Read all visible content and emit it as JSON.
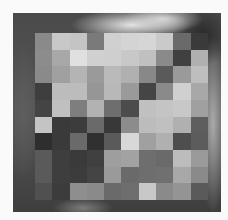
{
  "image": {
    "description": "Grayscale photograph with a pixelated mosaic region obscuring the center",
    "mosaic": {
      "rows": 10,
      "cols": 10,
      "cells": [
        [
          "#8a8a8a",
          "#c8c8c8",
          "#c4c4c4",
          "#7a7a7a",
          "#d0d0d0",
          "#d4d4d4",
          "#d6d6d6",
          "#cacaca",
          "#6a6a6a",
          "#3a3a3a"
        ],
        [
          "#8c8c8c",
          "#a8a8a8",
          "#e0e0e0",
          "#d0d0d0",
          "#cfcfcf",
          "#c8c8c8",
          "#c0c0c0",
          "#8a8a8a",
          "#404040",
          "#b0b0b0"
        ],
        [
          "#8a8a8a",
          "#a0a0a0",
          "#b4b4b4",
          "#9a9a9a",
          "#bababa",
          "#b0b0b0",
          "#888888",
          "#5a5a5a",
          "#9a9a9a",
          "#bebebe"
        ],
        [
          "#3e3e3e",
          "#bcbcbc",
          "#bcbcbc",
          "#969696",
          "#b8b8b8",
          "#9a9a9a",
          "#454545",
          "#8a8a8a",
          "#d0d0d0",
          "#a8a8a8"
        ],
        [
          "#444444",
          "#c0c0c0",
          "#7e7e7e",
          "#b2b2b2",
          "#6e6e6e",
          "#4c4c4c",
          "#c0c0c0",
          "#c4c4c4",
          "#c8c8c8",
          "#a0a0a0"
        ],
        [
          "#c4c4c4",
          "#3a3a3a",
          "#3c3c3c",
          "#6a6a6a",
          "#383838",
          "#8c8c8c",
          "#bcbcbc",
          "#c0c0c0",
          "#b0b0b0",
          "#5e5e5e"
        ],
        [
          "#2e2e2e",
          "#3a3a3a",
          "#6a6a6a",
          "#303030",
          "#5a5a5a",
          "#d8d8d8",
          "#a0a0a0",
          "#b0b0b0",
          "#4e4e4e",
          "#5c5c5c"
        ],
        [
          "#5a5a5a",
          "#3e3e3e",
          "#3a3a3a",
          "#404040",
          "#9e9e9e",
          "#a2a2a2",
          "#6e6e6e",
          "#6a6a6a",
          "#bcbcbc",
          "#9a9a9a"
        ],
        [
          "#5a5a5a",
          "#3e3e3e",
          "#3c3c3c",
          "#444444",
          "#9a9a9a",
          "#6a6a6a",
          "#6e6e6e",
          "#707070",
          "#a8a8a8",
          "#8a8a8a"
        ],
        [
          "#505050",
          "#3c3c3c",
          "#8e8e8e",
          "#8a8a8a",
          "#6a6a6a",
          "#6e6e6e",
          "#c8c8c8",
          "#8a8a8a",
          "#949494",
          "#5a5a5a"
        ]
      ]
    }
  }
}
